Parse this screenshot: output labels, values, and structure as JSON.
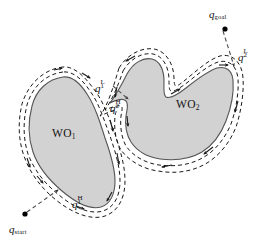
{
  "figure": {
    "kind": "motion-planning-diagram",
    "caption_absent": true,
    "colors": {
      "background": "#ffffff",
      "obstacle_fill": "#d2d2d2",
      "obstacle_stroke": "#555555",
      "path_stroke": "#1a1a1a",
      "connector_stroke": "#666666",
      "point_fill": "#000000",
      "label_color": "#111111"
    },
    "obstacles": [
      {
        "id": "WO1",
        "label_text": "WO",
        "label_sub": "1",
        "label_x": 52,
        "label_y": 128,
        "description": "rounded teardrop blob, left of figure"
      },
      {
        "id": "WO2",
        "label_text": "WO",
        "label_sub": "2",
        "label_x": 176,
        "label_y": 99,
        "description": "boomerang shape with concave notch at top, right of figure"
      }
    ],
    "points": [
      {
        "id": "q_start",
        "label_text": "q",
        "label_sub": "start",
        "label_x": 9,
        "label_y": 228,
        "dot_x": 25,
        "dot_y": 214
      },
      {
        "id": "q_goal",
        "label_text": "q",
        "label_sub": "goal",
        "label_x": 211,
        "label_y": 12,
        "dot_x": 225,
        "dot_y": 28
      }
    ],
    "hit_leave_labels": [
      {
        "id": "q1H",
        "label_text": "q",
        "label_sub": "1",
        "label_sup": "H",
        "label_x": 72,
        "label_y": 200,
        "role": "hit-point on WO1"
      },
      {
        "id": "q1L",
        "label_text": "q",
        "label_sub": "1",
        "label_sup": "L",
        "label_x": 96,
        "label_y": 84,
        "role": "leave-point on WO1"
      },
      {
        "id": "q2H",
        "label_text": "q",
        "label_sub": "2",
        "label_sup": "H",
        "label_x": 111,
        "label_y": 103,
        "role": "hit-point on WO2"
      },
      {
        "id": "q2L",
        "label_text": "q",
        "label_sub": "2",
        "label_sup": "L",
        "label_x": 239,
        "label_y": 53,
        "role": "leave-point on WO2"
      }
    ],
    "path": {
      "style": "dashed double contour following obstacle boundaries with direction arrowheads",
      "dash_pattern": "4 3",
      "connector_style": "dashed straight segments between start, hit/leave points and goal"
    }
  }
}
